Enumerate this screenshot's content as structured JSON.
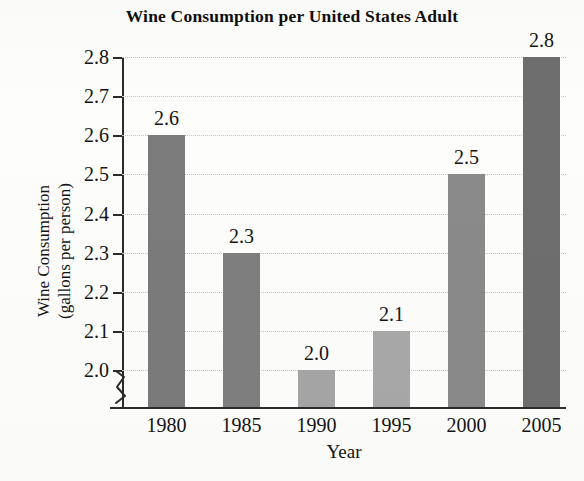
{
  "chart_data": {
    "type": "bar",
    "title": "Wine Consumption per United States Adult",
    "xlabel": "Year",
    "ylabel_line1": "Wine Consumption",
    "ylabel_line2": "(gallons per person)",
    "categories": [
      "1980",
      "1985",
      "1990",
      "1995",
      "2000",
      "2005"
    ],
    "values": [
      2.6,
      2.3,
      2.0,
      2.1,
      2.5,
      2.8
    ],
    "value_labels": [
      "2.6",
      "2.3",
      "2.0",
      "2.1",
      "2.5",
      "2.8"
    ],
    "bar_colors": [
      "#7b7b7b",
      "#7f7f7f",
      "#a5a5a5",
      "#a8a8a8",
      "#8a8a8a",
      "#6e6e6e"
    ],
    "ylim": [
      1.95,
      2.8
    ],
    "ytick_labels": [
      "2.0",
      "2.1",
      "2.2",
      "2.3",
      "2.4",
      "2.5",
      "2.6",
      "2.7",
      "2.8"
    ],
    "ytick_values": [
      2.0,
      2.1,
      2.2,
      2.3,
      2.4,
      2.5,
      2.6,
      2.7,
      2.8
    ],
    "grid": true,
    "grid_style": "dotted",
    "grid_color": "#c3c3c3",
    "axis_color": "#2b2b2b",
    "axis_break": true,
    "legend": "none",
    "background_color": "#fdfdfc"
  }
}
